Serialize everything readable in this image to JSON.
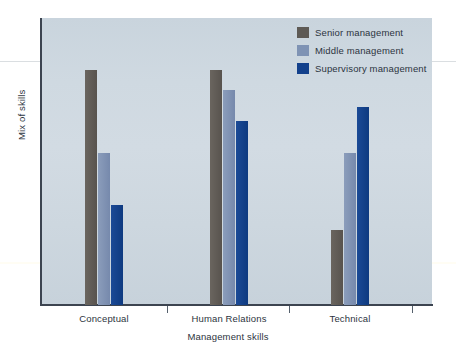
{
  "chart_data": {
    "type": "bar",
    "title": "",
    "subtitle": "",
    "xlabel": "Management skills",
    "ylabel": "Mix of skills",
    "categories": [
      "Conceptual",
      "Human Relations",
      "Technical"
    ],
    "series": [
      {
        "name": "Senior management",
        "color": "#5e5a55",
        "values": [
          82,
          82,
          26
        ]
      },
      {
        "name": "Middle management",
        "color": "#7f93b4",
        "values": [
          53,
          75,
          53
        ]
      },
      {
        "name": "Supervisory management",
        "color": "#13418c",
        "values": [
          35,
          64,
          69
        ]
      }
    ],
    "ylim": [
      0,
      100
    ],
    "axis_ticks_labeled": false,
    "grid": false,
    "legend_position": "top-right",
    "annotations": []
  },
  "legend": {
    "items": [
      {
        "label": "Senior management",
        "swatch": "senior"
      },
      {
        "label": "Middle management",
        "swatch": "middle"
      },
      {
        "label": "Supervisory management",
        "swatch": "supervisory"
      }
    ]
  },
  "colors": {
    "plot_background": "#ced8e0",
    "axis": "#3c4450",
    "text": "#2c3440",
    "page_background": "#ffffff",
    "senior": "#5e5a55",
    "middle": "#7f93b4",
    "supervisory": "#13418c"
  }
}
